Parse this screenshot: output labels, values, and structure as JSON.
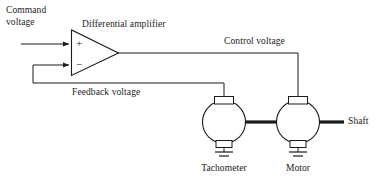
{
  "diagram": {
    "stroke_color": "#1a1a1a",
    "background_color": "#ffffff",
    "labels": {
      "command_voltage_line1": "Command",
      "command_voltage_line2": "voltage",
      "differential_amplifier": "Differential amplifier",
      "control_voltage": "Control voltage",
      "feedback_voltage": "Feedback voltage",
      "tachometer": "Tachometer",
      "motor": "Motor",
      "shaft": "Shaft",
      "plus_sign": "+",
      "minus_sign": "−"
    },
    "components": [
      {
        "name": "differential-amplifier",
        "type": "triangle"
      },
      {
        "name": "tachometer",
        "type": "circle"
      },
      {
        "name": "motor",
        "type": "circle"
      }
    ],
    "signals": [
      {
        "name": "command-voltage",
        "from": "input",
        "to": "amplifier-plus-input"
      },
      {
        "name": "control-voltage",
        "from": "amplifier-output",
        "to": "motor"
      },
      {
        "name": "feedback-voltage",
        "from": "tachometer",
        "to": "amplifier-minus-input"
      }
    ]
  }
}
